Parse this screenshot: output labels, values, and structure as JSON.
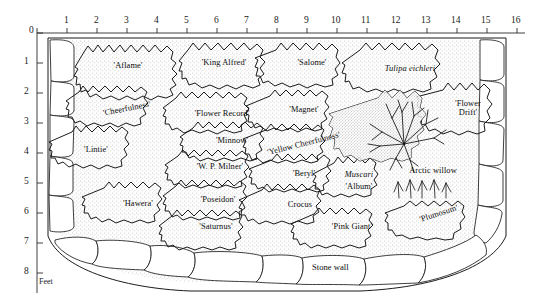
{
  "figure": {
    "kind": "garden-planting-plan",
    "unit_label": "Feet",
    "stone_wall_label": "Stone wall"
  },
  "top_ruler": {
    "origin": "0",
    "ticks": [
      "1",
      "2",
      "3",
      "4",
      "5",
      "6",
      "7",
      "8",
      "9",
      "10",
      "11",
      "12",
      "13",
      "14",
      "15",
      "16"
    ]
  },
  "left_ruler": {
    "origin": "0",
    "ticks": [
      "1",
      "2",
      "3",
      "4",
      "5",
      "6",
      "7",
      "8"
    ]
  },
  "beds": [
    {
      "id": "aflame",
      "label": "'Aflame'",
      "x": 128,
      "y": 67,
      "style": "plain"
    },
    {
      "id": "king-alfred",
      "label": "'King Alfred'",
      "x": 224,
      "y": 64,
      "style": "plain"
    },
    {
      "id": "salome",
      "label": "'Salome'",
      "x": 312,
      "y": 64,
      "style": "plain"
    },
    {
      "id": "tulipa-eichleri",
      "label": "Tulipa eichleri",
      "x": 410,
      "y": 70,
      "style": "italic"
    },
    {
      "id": "cheerfulness",
      "label": "'Cheerfulness'",
      "x": 127,
      "y": 110,
      "style": "rotated"
    },
    {
      "id": "flower-record",
      "label": "'Flower Record'",
      "x": 222,
      "y": 115,
      "style": "plain"
    },
    {
      "id": "magnet",
      "label": "'Magnet'",
      "x": 304,
      "y": 111,
      "style": "plain"
    },
    {
      "id": "flower-drift",
      "label": "'Flower Drift'",
      "x": 468,
      "y": 107,
      "style": "two-line"
    },
    {
      "id": "lintie",
      "label": "'Lintie'",
      "x": 96,
      "y": 151,
      "style": "plain"
    },
    {
      "id": "minnow",
      "label": "'Minnow'",
      "x": 232,
      "y": 142,
      "style": "plain"
    },
    {
      "id": "yellow-cheerfulness",
      "label": "'Yellow Cheerfulness'",
      "x": 303,
      "y": 145,
      "style": "rotated-slight"
    },
    {
      "id": "wp-milner",
      "label": "'W. P. Milner'",
      "x": 220,
      "y": 168,
      "style": "plain"
    },
    {
      "id": "beryl",
      "label": "'Beryl'",
      "x": 303,
      "y": 175,
      "style": "plain"
    },
    {
      "id": "muscari-album",
      "label": "Muscari",
      "x": 358,
      "y": 176,
      "style": "italic"
    },
    {
      "id": "muscari-album-cv",
      "label": "'Album'",
      "x": 358,
      "y": 188,
      "style": "plain"
    },
    {
      "id": "arctic-willow",
      "label": "Arctic willow",
      "x": 432,
      "y": 172,
      "style": "plain"
    },
    {
      "id": "hawera",
      "label": "'Hawera'",
      "x": 137,
      "y": 205,
      "style": "plain"
    },
    {
      "id": "poseidon",
      "label": "'Poseidon'",
      "x": 217,
      "y": 201,
      "style": "plain"
    },
    {
      "id": "crocus",
      "label": "Crocus",
      "x": 299,
      "y": 206,
      "style": "plain"
    },
    {
      "id": "plumosum",
      "label": "'Plumosum'",
      "x": 438,
      "y": 215,
      "style": "rotated-neg"
    },
    {
      "id": "saturnus",
      "label": "'Saturnus'",
      "x": 215,
      "y": 228,
      "style": "plain"
    },
    {
      "id": "pink-giant",
      "label": "'Pink Giant'",
      "x": 351,
      "y": 228,
      "style": "plain"
    }
  ]
}
